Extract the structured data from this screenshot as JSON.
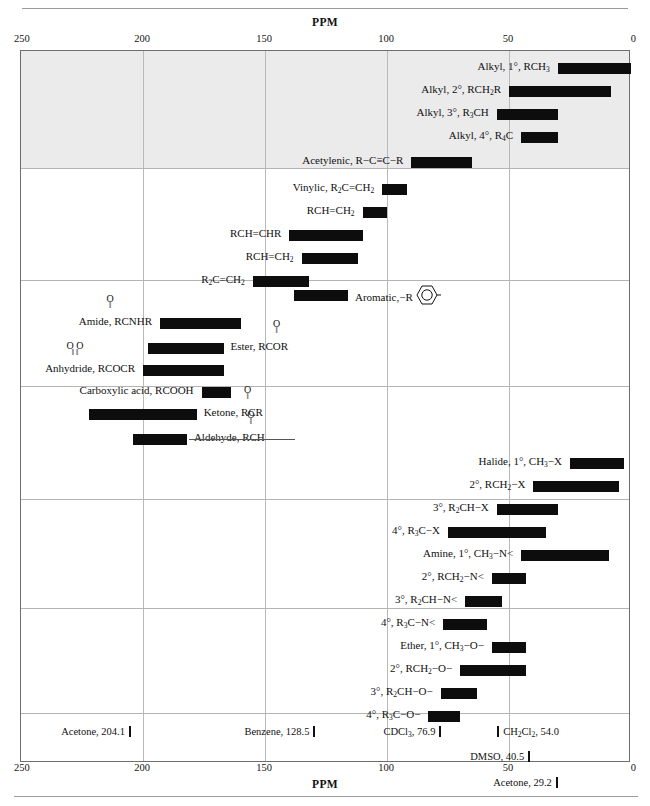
{
  "chart_data": {
    "type": "bar",
    "title": "PPM",
    "xlabel": "PPM",
    "ylabel": "",
    "xlim": [
      250,
      0
    ],
    "x_ticks": [
      250,
      200,
      150,
      100,
      50,
      0
    ],
    "grid": true,
    "orientation": "horizontal-ranges",
    "axis_inverted": true,
    "categories": [
      "Alkyl, 1°, RCH3",
      "Alkyl, 2°, RCH2R",
      "Alkyl, 3°, R3CH",
      "Alkyl, 4°, R4C",
      "Acetylenic, R-C≡C-R",
      "Vinylic, R2C=CH2",
      "RCH=CH2",
      "RCH=CHR",
      "RCH=CH2",
      "R2C=CH2",
      "Aromatic",
      "Amide, RCONHR",
      "Ester, RCOOR",
      "Anhydride, RCOOCR",
      "Carboxylic acid, RCOOH",
      "Ketone, RCOR",
      "Aldehyde, RCHO",
      "Halide, 1°, CH3-X",
      "Halide, 2°, RCH2-X",
      "Halide, 3°, R2CH-X",
      "Halide, 4°, R3C-X",
      "Amine, 1°, CH3-N",
      "Amine, 2°, RCH2-N",
      "Amine, 3°, R2CH-N",
      "Amine, 4°, R3C-N",
      "Ether, 1°, CH3-O",
      "Ether, 2°, RCH2-O",
      "Ether, 3°, R2CH-O",
      "Ether, 4°, R3C-O"
    ],
    "ranges_ppm": [
      [
        0,
        30
      ],
      [
        8,
        50
      ],
      [
        30,
        55
      ],
      [
        30,
        45
      ],
      [
        65,
        90
      ],
      [
        92,
        102
      ],
      [
        100,
        110
      ],
      [
        110,
        140
      ],
      [
        112,
        135
      ],
      [
        132,
        155
      ],
      [
        116,
        138
      ],
      [
        160,
        193
      ],
      [
        167,
        198
      ],
      [
        167,
        200
      ],
      [
        164,
        176
      ],
      [
        178,
        222
      ],
      [
        182,
        204
      ],
      [
        3,
        25
      ],
      [
        5,
        40
      ],
      [
        30,
        55
      ],
      [
        35,
        75
      ],
      [
        9,
        45
      ],
      [
        43,
        57
      ],
      [
        53,
        68
      ],
      [
        59,
        77
      ],
      [
        43,
        57
      ],
      [
        43,
        70
      ],
      [
        63,
        78
      ],
      [
        70,
        83
      ]
    ],
    "solvent_markers": [
      {
        "name": "Acetone",
        "ppm": 204.1
      },
      {
        "name": "Benzene",
        "ppm": 128.5
      },
      {
        "name": "CDCl3",
        "ppm": 76.9
      },
      {
        "name": "CH2Cl2",
        "ppm": 54.0
      },
      {
        "name": "DMSO",
        "ppm": 40.5
      },
      {
        "name": "Acetone",
        "ppm": 29.2
      }
    ]
  },
  "axis": {
    "title": "PPM",
    "ticks": [
      {
        "label": "250",
        "ppm": 250
      },
      {
        "label": "200",
        "ppm": 200
      },
      {
        "label": "150",
        "ppm": 150
      },
      {
        "label": "100",
        "ppm": 100
      },
      {
        "label": "50",
        "ppm": 50
      },
      {
        "label": "0",
        "ppm": 0
      }
    ]
  },
  "rows": {
    "alkyl1": {
      "label": "Alkyl, 1°, RCH",
      "sub": "3"
    },
    "alkyl2_a": {
      "label": "Alkyl, 2°, RCH",
      "sub": "2",
      "tail": "R"
    },
    "alkyl3": {
      "label": "Alkyl, 3°, R",
      "sub": "3",
      "tail": "CH"
    },
    "alkyl4": {
      "label": "Alkyl, 4°, R",
      "sub": "4",
      "tail": "C"
    },
    "acetylenic": {
      "label": "Acetylenic, R−C≡C−R"
    },
    "vinylic1": {
      "label": "Vinylic, R",
      "sub": "2",
      "tail": "C=CH",
      "sub2": "2"
    },
    "vinylic2": {
      "label": "RCH=CH",
      "sub": "2"
    },
    "vinylic3": {
      "label": "RCH=CHR"
    },
    "vinylic4": {
      "label": "RCH=CH",
      "sub": "2"
    },
    "vinylic5": {
      "label": "R",
      "sub": "2",
      "tail": "C=CH",
      "sub2": "2"
    },
    "aromatic": {
      "label": "Aromatic,",
      "tail": "−R"
    },
    "amide": {
      "label": "Amide, RCNHR",
      "carbonyl": "O"
    },
    "ester": {
      "label": "Ester, RCOR",
      "carbonyl": "O"
    },
    "anhydride": {
      "label": "Anhydride, RCOCR",
      "carbonyl": "O  O"
    },
    "carboxylic": {
      "label": "Carboxylic acid, RCOOH"
    },
    "ketone": {
      "label": "Ketone, RCR",
      "carbonyl": "O"
    },
    "aldehyde": {
      "label": "Aldehyde, RCH",
      "carbonyl": "O"
    },
    "halide1": {
      "label": "Halide, 1°, CH",
      "sub": "3",
      "tail": "−X"
    },
    "halide2": {
      "label": "2°, RCH",
      "sub": "2",
      "tail": "−X"
    },
    "halide3": {
      "label": "3°, R",
      "sub": "2",
      "tail": "CH−X"
    },
    "halide4": {
      "label": "4°, R",
      "sub": "3",
      "tail": "C−X"
    },
    "amine1": {
      "label": "Amine, 1°, CH",
      "sub": "3",
      "tail": "−N<"
    },
    "amine2": {
      "label": "2°, RCH",
      "sub": "2",
      "tail": "−N<"
    },
    "amine3": {
      "label": "3°, R",
      "sub": "2",
      "tail": "CH−N<"
    },
    "amine4": {
      "label": "4°, R",
      "sub": "3",
      "tail": "C−N<"
    },
    "ether1": {
      "label": "Ether, 1°, CH",
      "sub": "3",
      "tail": "−O−"
    },
    "ether2": {
      "label": "2°, RCH",
      "sub": "2",
      "tail": "−O−"
    },
    "ether3": {
      "label": "3°, R",
      "sub": "2",
      "tail": "CH−O−"
    },
    "ether4": {
      "label": "4°, R",
      "sub": "3",
      "tail": "C−O−"
    }
  },
  "solvents": {
    "acetone_204": {
      "name": "Acetone,",
      "value": "204.1"
    },
    "benzene_128": {
      "name": "Benzene,",
      "value": "128.5"
    },
    "cdcl3_76": {
      "name": "CDCl",
      "sub": "3",
      "value": ", 76.9"
    },
    "ch2cl2_54": {
      "name": "CH",
      "sub": "2",
      "name2": "Cl",
      "sub2": "2",
      "value": ", 54.0"
    },
    "dmso_40": {
      "name": "DMSO,",
      "value": "40.5"
    },
    "acetone_29": {
      "name": "Acetone,",
      "value": "29.2"
    }
  },
  "colors": {
    "bar": "#0d0d0d",
    "frame": "#6e6e6e",
    "grid": "#b9b9b9",
    "shade": "#ebebeb",
    "text": "#111111"
  }
}
